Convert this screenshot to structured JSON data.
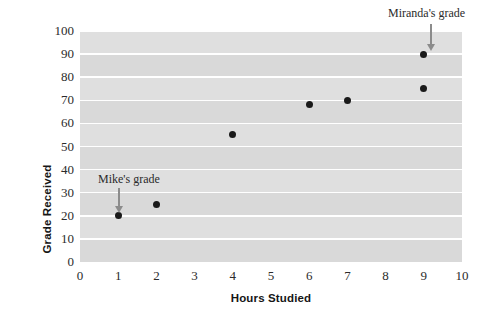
{
  "chart_data": {
    "type": "scatter",
    "title": "",
    "xlabel": "Hours Studied",
    "ylabel": "Grade Received",
    "xlim": [
      0,
      10
    ],
    "ylim": [
      0,
      100
    ],
    "xticks": [
      "0",
      "1",
      "2",
      "3",
      "4",
      "5",
      "6",
      "7",
      "8",
      "9",
      "10"
    ],
    "yticks": [
      "0",
      "10",
      "20",
      "30",
      "40",
      "50",
      "60",
      "70",
      "80",
      "90",
      "100"
    ],
    "grid": "horizontal",
    "legend": "none",
    "plot_background_color": "#dcdcdc",
    "gridline_color": "#ffffff",
    "point_color": "#1a1a1a",
    "points": [
      {
        "x": 1,
        "y": 20,
        "label": "Mike's grade"
      },
      {
        "x": 2,
        "y": 25,
        "label": ""
      },
      {
        "x": 4,
        "y": 55,
        "label": ""
      },
      {
        "x": 6,
        "y": 68,
        "label": ""
      },
      {
        "x": 7,
        "y": 70,
        "label": ""
      },
      {
        "x": 9,
        "y": 90,
        "label": "Miranda's grade"
      },
      {
        "x": 9,
        "y": 75,
        "label": ""
      }
    ],
    "annotations": [
      {
        "text": "Mike's grade",
        "points_to_x": 1,
        "points_to_y": 20
      },
      {
        "text": "Miranda's grade",
        "points_to_x": 9,
        "points_to_y": 90
      }
    ]
  }
}
